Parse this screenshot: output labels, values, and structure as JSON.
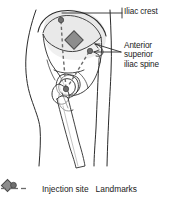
{
  "figure": {
    "title": "Ventrogluteal injection site and bony landmarks",
    "width": 179,
    "height": 206
  },
  "labels": {
    "iliac_crest": "Iliac crest",
    "asis_line1": "Anterior",
    "asis_line2": "superior",
    "asis_line3": "iliac spine"
  },
  "legend": {
    "injection_site_label": "Injection site",
    "landmarks_label": "Landmarks"
  },
  "colors": {
    "outline": "#2b2b2b",
    "bone_fill": "#ffffff",
    "soft_tissue_fill": "#e8e8e8",
    "marker_fill": "#8d8d8d",
    "marker_stroke": "#4a4a4a",
    "landmark_dot": "#6b6b6b",
    "dashed_line": "#6b6b6b",
    "text": "#1a1a1a",
    "background": "#ffffff"
  },
  "anatomy": {
    "parts": [
      "body-outline",
      "iliac-crest",
      "ilium",
      "pelvis",
      "acetabulum",
      "femur-head",
      "greater-trochanter",
      "femur-shaft"
    ]
  },
  "markers": {
    "injection_site": {
      "shape": "diamond",
      "x": 74,
      "y": 40
    },
    "landmarks": [
      {
        "name": "iliac-crest-landmark",
        "x": 61,
        "y": 20
      },
      {
        "name": "anterior-superior-iliac-spine-landmark",
        "x": 90,
        "y": 51
      },
      {
        "name": "greater-trochanter-landmark",
        "x": 66,
        "y": 89
      }
    ]
  }
}
